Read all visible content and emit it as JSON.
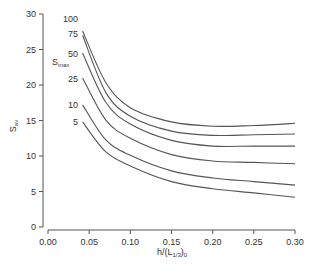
{
  "chart_data": {
    "type": "line",
    "title": "",
    "xlabel": "h/(L1/3)0",
    "xlabel_main": "h/(L",
    "xlabel_sub": "1/3",
    "xlabel_close": ")",
    "xlabel_sub2": "0",
    "ylabel": "Sav",
    "ylabel_main": "S",
    "ylabel_sub": "av",
    "legend_title": "Smax",
    "legend_title_main": "S",
    "legend_title_sub": "max",
    "xlim": [
      0.0,
      0.3
    ],
    "ylim": [
      0,
      30
    ],
    "grid": false,
    "x_ticks": [
      "0.00",
      "0.05",
      "0.10",
      "0.15",
      "0.20",
      "0.25",
      "0.30"
    ],
    "y_ticks": [
      "0",
      "5",
      "10",
      "15",
      "20",
      "25",
      "30"
    ],
    "x": [
      0.042,
      0.07,
      0.1,
      0.15,
      0.2,
      0.25,
      0.3
    ],
    "series": [
      {
        "name": "100",
        "values": [
          27.6,
          20.4,
          16.8,
          14.8,
          14.2,
          14.3,
          14.6
        ]
      },
      {
        "name": "75",
        "values": [
          27.0,
          19.0,
          15.6,
          13.5,
          12.9,
          13.0,
          13.1
        ]
      },
      {
        "name": "50",
        "values": [
          24.5,
          17.6,
          14.5,
          12.2,
          11.4,
          11.4,
          11.4
        ]
      },
      {
        "name": "25",
        "values": [
          21.0,
          15.1,
          12.5,
          10.2,
          9.3,
          9.1,
          8.9
        ]
      },
      {
        "name": "10",
        "values": [
          17.2,
          12.3,
          10.1,
          7.9,
          6.9,
          6.4,
          5.9
        ]
      },
      {
        "name": "5",
        "values": [
          14.8,
          10.6,
          8.6,
          6.4,
          5.4,
          4.8,
          4.2
        ]
      }
    ]
  }
}
